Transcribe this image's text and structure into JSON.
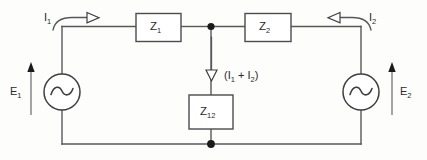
{
  "diagram": {
    "type": "electrical-schematic",
    "background_color": "#fdfdfc",
    "line_color": "#58585a",
    "components": {
      "impedance_z1": {
        "label": "Z",
        "subscript": "1"
      },
      "impedance_z2": {
        "label": "Z",
        "subscript": "2"
      },
      "impedance_z12": {
        "label": "Z",
        "subscript": "12"
      },
      "source_left": {
        "label": "E",
        "subscript": "1",
        "symbol": "ac-source-sine"
      },
      "source_right": {
        "label": "E",
        "subscript": "2",
        "symbol": "ac-source-sine"
      }
    },
    "currents": {
      "current_left": {
        "label": "I",
        "subscript": "1",
        "direction": "right"
      },
      "current_right": {
        "label": "I",
        "subscript": "2",
        "direction": "left"
      },
      "current_shunt": {
        "prefix": "(I",
        "sub1": "1",
        "operator": " + I",
        "sub2": "2",
        "suffix": ")",
        "direction": "down"
      }
    },
    "nodes": {
      "top_center": "junction-dot",
      "bottom_center": "junction-dot"
    }
  }
}
